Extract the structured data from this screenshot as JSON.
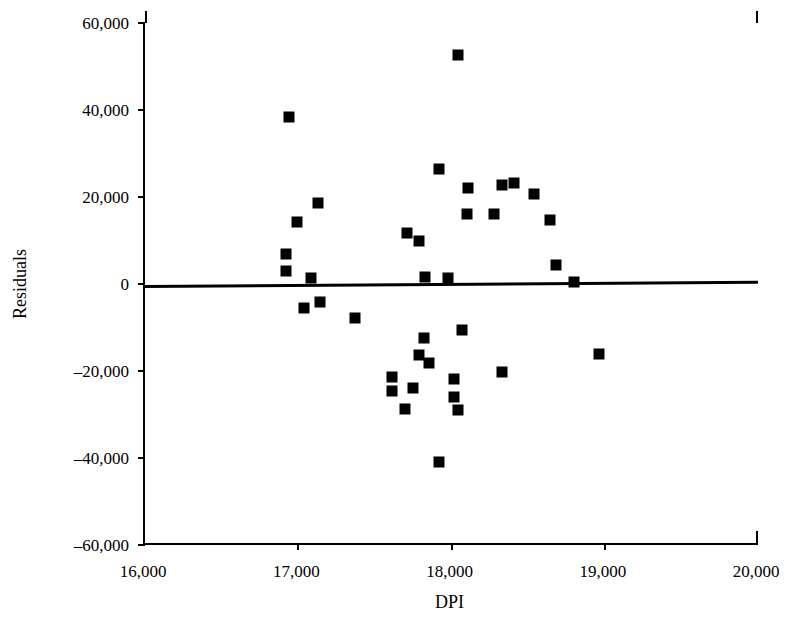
{
  "chart_data": {
    "type": "scatter",
    "title": "",
    "xlabel": "DPI",
    "ylabel": "Residuals",
    "xlim": [
      16000,
      20000
    ],
    "ylim": [
      -60000,
      60000
    ],
    "xticks": [
      16000,
      17000,
      18000,
      19000,
      20000
    ],
    "yticks": [
      60000,
      40000,
      20000,
      0,
      -20000,
      -40000,
      -60000
    ],
    "xtick_labels": [
      "16,000",
      "17,000",
      "18,000",
      "19,000",
      "20,000"
    ],
    "ytick_labels": [
      "60,000",
      "40,000",
      "20,000",
      "0",
      "–20,000",
      "–40,000",
      "–60,000"
    ],
    "grid": false,
    "legend": null,
    "marker": {
      "shape": "square",
      "color": "#000000",
      "size_px": 11
    },
    "trend_line": {
      "label": "zero-residual reference line",
      "color": "#000000",
      "width_px": 3,
      "x_start": 16000,
      "y_start": -250,
      "x_end": 20000,
      "y_end": 700
    },
    "points": [
      {
        "x": 16920,
        "y": 6900
      },
      {
        "x": 16920,
        "y": 3000
      },
      {
        "x": 16940,
        "y": 38500
      },
      {
        "x": 16995,
        "y": 14300
      },
      {
        "x": 17040,
        "y": -5500
      },
      {
        "x": 17080,
        "y": 1400
      },
      {
        "x": 17130,
        "y": 18600
      },
      {
        "x": 17140,
        "y": -4100
      },
      {
        "x": 17370,
        "y": -7800
      },
      {
        "x": 17610,
        "y": -21400
      },
      {
        "x": 17615,
        "y": -24600
      },
      {
        "x": 17710,
        "y": 11700
      },
      {
        "x": 17750,
        "y": -23800
      },
      {
        "x": 17790,
        "y": 9900
      },
      {
        "x": 17790,
        "y": -16300
      },
      {
        "x": 17695,
        "y": -28800
      },
      {
        "x": 17820,
        "y": -12400
      },
      {
        "x": 17830,
        "y": 1600
      },
      {
        "x": 17850,
        "y": -18100
      },
      {
        "x": 17920,
        "y": 26400
      },
      {
        "x": 17920,
        "y": -40900
      },
      {
        "x": 17980,
        "y": 1400
      },
      {
        "x": 18015,
        "y": -21900
      },
      {
        "x": 18015,
        "y": -26000
      },
      {
        "x": 18040,
        "y": 52700
      },
      {
        "x": 18040,
        "y": -29000
      },
      {
        "x": 18070,
        "y": -10600
      },
      {
        "x": 18100,
        "y": 16100
      },
      {
        "x": 18110,
        "y": 22100
      },
      {
        "x": 18280,
        "y": 16100
      },
      {
        "x": 18330,
        "y": 22800
      },
      {
        "x": 18330,
        "y": -20300
      },
      {
        "x": 18410,
        "y": 23200
      },
      {
        "x": 18540,
        "y": 20700
      },
      {
        "x": 18645,
        "y": 14700
      },
      {
        "x": 18680,
        "y": 4400
      },
      {
        "x": 18800,
        "y": 400
      },
      {
        "x": 18960,
        "y": -16100
      }
    ],
    "point_count": 38
  },
  "axes": {
    "y_title": "Residuals",
    "x_title": "DPI"
  }
}
